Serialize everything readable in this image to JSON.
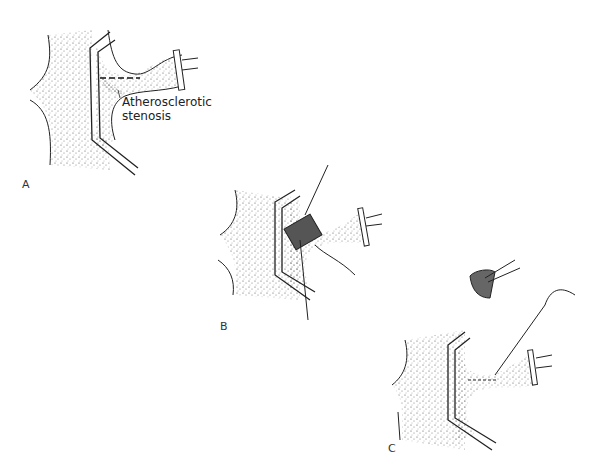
{
  "figure": {
    "panels": [
      {
        "id": "A",
        "label": "A",
        "annotation": {
          "line1": "Atherosclerotic",
          "line2": "stenosis"
        }
      },
      {
        "id": "B",
        "label": "B"
      },
      {
        "id": "C",
        "label": "C"
      }
    ]
  }
}
